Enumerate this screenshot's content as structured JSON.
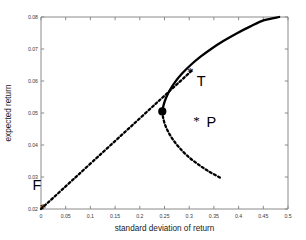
{
  "chart_data": {
    "type": "line",
    "title": "",
    "xlabel": "standard deviation of return",
    "ylabel": "expected return",
    "xlim": [
      0,
      0.5
    ],
    "ylim": [
      0.02,
      0.08
    ],
    "grid": false,
    "legend": "none",
    "xticks": [
      "0",
      "0.05",
      "0.1",
      "0.15",
      "0.2",
      "0.25",
      "0.3",
      "0.35",
      "0.4",
      "0.45",
      "0.5"
    ],
    "xtick_values": [
      0,
      0.05,
      0.1,
      0.15,
      0.2,
      0.25,
      0.3,
      0.35,
      0.4,
      0.45,
      0.5
    ],
    "yticks": [
      "0.02",
      "0.03",
      "0.04",
      "0.05",
      "0.06",
      "0.07",
      "0.08"
    ],
    "ytick_values": [
      0.02,
      0.03,
      0.04,
      0.05,
      0.06,
      0.07,
      0.08
    ],
    "series": [
      {
        "name": "efficient-frontier-upper",
        "style": "solid",
        "x": [
          0.2455,
          0.248,
          0.253,
          0.261,
          0.272,
          0.286,
          0.303,
          0.323,
          0.345,
          0.369,
          0.395,
          0.423,
          0.452,
          0.482
        ],
        "y": [
          0.0505,
          0.0524,
          0.0547,
          0.0572,
          0.0598,
          0.0624,
          0.065,
          0.0676,
          0.0701,
          0.0725,
          0.0748,
          0.077,
          0.079,
          0.08
        ]
      },
      {
        "name": "inefficient-frontier-lower",
        "style": "dashed",
        "x": [
          0.2455,
          0.247,
          0.251,
          0.258,
          0.268,
          0.281,
          0.297,
          0.316,
          0.337,
          0.36,
          0.362
        ],
        "y": [
          0.0505,
          0.0487,
          0.0464,
          0.044,
          0.0415,
          0.039,
          0.0365,
          0.0342,
          0.032,
          0.03,
          0.0298
        ]
      },
      {
        "name": "capital-market-line",
        "style": "dashed",
        "x": [
          0.0,
          0.305
        ],
        "y": [
          0.02,
          0.0632
        ]
      }
    ],
    "points": [
      {
        "label": "F",
        "marker": "asterisk",
        "x": 0.004,
        "y": 0.0205,
        "label_dx": -0.012,
        "label_dy": 0.0072
      },
      {
        "label": "T",
        "marker": "asterisk",
        "x": 0.302,
        "y": 0.063,
        "label_dx": 0.022,
        "label_dy": -0.0028
      },
      {
        "label": "P",
        "marker": "asterisk",
        "x": 0.315,
        "y": 0.0477,
        "label_dx": 0.03,
        "label_dy": -0.0005
      }
    ],
    "markers": [
      {
        "name": "minimum-variance-point",
        "shape": "filled-circle",
        "x": 0.2455,
        "y": 0.0505
      }
    ]
  },
  "colors": {
    "curve": "#000000",
    "axis": "#8a8a8a",
    "tick_text": "#3a3a3a",
    "label_text": "#1a1a1a",
    "background": "#ffffff"
  }
}
